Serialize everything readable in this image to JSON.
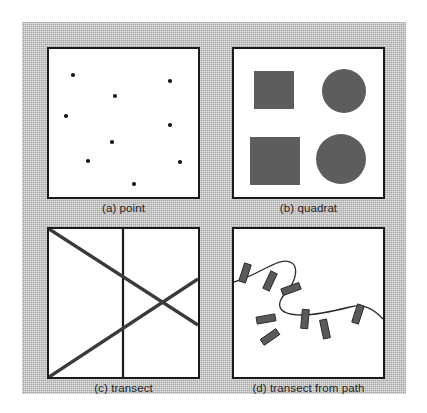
{
  "figure": {
    "background_color": "#b9b9b9",
    "panel_background": "#ffffff",
    "border_color": "#1a1a1a",
    "shape_fill": "#5d5d5d",
    "point_fill": "#141414",
    "line_color": "#3a3a3a",
    "panels": [
      {
        "id": "point",
        "caption": "(a) point"
      },
      {
        "id": "quadrat",
        "caption": "(b) quadrat"
      },
      {
        "id": "transect",
        "caption": "(c) transect"
      },
      {
        "id": "path",
        "caption": "(d) transect from path"
      }
    ]
  },
  "chart_data": {
    "type": "diagram",
    "panel_count": 4,
    "panels": [
      {
        "label": "(a) point",
        "kind": "point-samples",
        "viewbox": [
          0,
          0,
          149,
          148
        ],
        "point_radius": 2.1,
        "points": [
          [
            24,
            26
          ],
          [
            66,
            47
          ],
          [
            121,
            32
          ],
          [
            17,
            67
          ],
          [
            121,
            76
          ],
          [
            63,
            93
          ],
          [
            39,
            112
          ],
          [
            131,
            113
          ],
          [
            85,
            135
          ]
        ]
      },
      {
        "label": "(b) quadrat",
        "kind": "quadrat-samples",
        "viewbox": [
          0,
          0,
          149,
          148
        ],
        "squares": [
          {
            "x": 20,
            "y": 22,
            "w": 40,
            "h": 38
          },
          {
            "x": 16,
            "y": 88,
            "w": 50,
            "h": 48
          }
        ],
        "circles": [
          {
            "cx": 110,
            "cy": 42,
            "r": 22
          },
          {
            "cx": 107,
            "cy": 110,
            "r": 25
          }
        ]
      },
      {
        "label": "(c) transect",
        "kind": "transect-lines",
        "viewbox": [
          0,
          0,
          149,
          148
        ],
        "divider": {
          "x1": 74,
          "y1": 0,
          "x2": 74,
          "y2": 148
        },
        "transects": [
          {
            "x1": 0,
            "y1": 0,
            "x2": 149,
            "y2": 96
          },
          {
            "x1": 0,
            "y1": 148,
            "x2": 149,
            "y2": 50
          }
        ]
      },
      {
        "label": "(d) transect from path",
        "kind": "transects-from-path",
        "viewbox": [
          0,
          0,
          149,
          148
        ],
        "path": "M 0,53 C 14,49 24,43 34,38 C 44,33 52,30 58,34 C 64,38 62,50 56,58 C 50,66 44,72 46,78 C 48,84 56,86 68,86 C 84,86 100,82 116,78 C 128,75 138,78 149,90",
        "tick_count": 8,
        "ticks": [
          {
            "cx": 11,
            "cy": 44,
            "w": 7,
            "h": 19,
            "rotation": 18
          },
          {
            "cx": 36,
            "cy": 52,
            "w": 7,
            "h": 19,
            "rotation": 25
          },
          {
            "cx": 57,
            "cy": 60,
            "w": 7,
            "h": 19,
            "rotation": 70
          },
          {
            "cx": 32,
            "cy": 90,
            "w": 7,
            "h": 19,
            "rotation": 80
          },
          {
            "cx": 36,
            "cy": 108,
            "w": 7,
            "h": 19,
            "rotation": 55
          },
          {
            "cx": 71,
            "cy": 90,
            "w": 7,
            "h": 19,
            "rotation": 5
          },
          {
            "cx": 91,
            "cy": 100,
            "w": 7,
            "h": 19,
            "rotation": -12
          },
          {
            "cx": 124,
            "cy": 85,
            "w": 7,
            "h": 19,
            "rotation": 18
          }
        ]
      }
    ]
  }
}
